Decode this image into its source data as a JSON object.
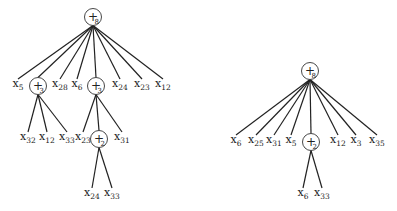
{
  "trees": [
    {
      "name": "left-tree",
      "nodes": [
        {
          "id": "L0",
          "type": "op",
          "op": "+",
          "arity": "8",
          "x": 93,
          "y": 17
        },
        {
          "id": "L1",
          "type": "leaf",
          "var": "x",
          "index": "5",
          "x": 18,
          "y": 87,
          "parent": "L0"
        },
        {
          "id": "L2",
          "type": "op",
          "op": "+",
          "arity": "3",
          "x": 38,
          "y": 86,
          "parent": "L0"
        },
        {
          "id": "L3",
          "type": "leaf",
          "var": "x",
          "index": "28",
          "x": 60,
          "y": 87,
          "parent": "L0"
        },
        {
          "id": "L4",
          "type": "leaf",
          "var": "x",
          "index": "6",
          "x": 77,
          "y": 87,
          "parent": "L0"
        },
        {
          "id": "L5",
          "type": "op",
          "op": "+",
          "arity": "3",
          "x": 96,
          "y": 86,
          "parent": "L0"
        },
        {
          "id": "L6",
          "type": "leaf",
          "var": "x",
          "index": "24",
          "x": 120,
          "y": 87,
          "parent": "L0"
        },
        {
          "id": "L7",
          "type": "leaf",
          "var": "x",
          "index": "23",
          "x": 142,
          "y": 87,
          "parent": "L0"
        },
        {
          "id": "L8",
          "type": "leaf",
          "var": "x",
          "index": "12",
          "x": 163,
          "y": 87,
          "parent": "L0"
        },
        {
          "id": "L9",
          "type": "leaf",
          "var": "x",
          "index": "32",
          "x": 28,
          "y": 140,
          "parent": "L2"
        },
        {
          "id": "L10",
          "type": "leaf",
          "var": "x",
          "index": "12",
          "x": 47,
          "y": 140,
          "parent": "L2"
        },
        {
          "id": "L11",
          "type": "leaf",
          "var": "x",
          "index": "33",
          "x": 67,
          "y": 140,
          "parent": "L2"
        },
        {
          "id": "L12",
          "type": "leaf",
          "var": "x",
          "index": "23",
          "x": 83,
          "y": 140,
          "parent": "L5"
        },
        {
          "id": "L13",
          "type": "op",
          "op": "+",
          "arity": "2",
          "x": 99,
          "y": 139,
          "parent": "L5"
        },
        {
          "id": "L14",
          "type": "leaf",
          "var": "x",
          "index": "31",
          "x": 122,
          "y": 140,
          "parent": "L5"
        },
        {
          "id": "L15",
          "type": "leaf",
          "var": "x",
          "index": "24",
          "x": 92,
          "y": 196,
          "parent": "L13"
        },
        {
          "id": "L16",
          "type": "leaf",
          "var": "x",
          "index": "33",
          "x": 112,
          "y": 196,
          "parent": "L13"
        }
      ]
    },
    {
      "name": "right-tree",
      "nodes": [
        {
          "id": "R0",
          "type": "op",
          "op": "+",
          "arity": "8",
          "x": 310,
          "y": 71
        },
        {
          "id": "R1",
          "type": "leaf",
          "var": "x",
          "index": "6",
          "x": 236,
          "y": 143,
          "parent": "R0"
        },
        {
          "id": "R2",
          "type": "leaf",
          "var": "x",
          "index": "25",
          "x": 256,
          "y": 143,
          "parent": "R0"
        },
        {
          "id": "R3",
          "type": "leaf",
          "var": "x",
          "index": "31",
          "x": 274,
          "y": 143,
          "parent": "R0"
        },
        {
          "id": "R4",
          "type": "leaf",
          "var": "x",
          "index": "5",
          "x": 291,
          "y": 143,
          "parent": "R0"
        },
        {
          "id": "R5",
          "type": "op",
          "op": "+",
          "arity": "2",
          "x": 311,
          "y": 142,
          "parent": "R0"
        },
        {
          "id": "R6",
          "type": "leaf",
          "var": "x",
          "index": "12",
          "x": 338,
          "y": 143,
          "parent": "R0"
        },
        {
          "id": "R7",
          "type": "leaf",
          "var": "x",
          "index": "3",
          "x": 356,
          "y": 143,
          "parent": "R0"
        },
        {
          "id": "R8",
          "type": "leaf",
          "var": "x",
          "index": "35",
          "x": 377,
          "y": 143,
          "parent": "R0"
        },
        {
          "id": "R9",
          "type": "leaf",
          "var": "x",
          "index": "6",
          "x": 303,
          "y": 196,
          "parent": "R5"
        },
        {
          "id": "R10",
          "type": "leaf",
          "var": "x",
          "index": "33",
          "x": 322,
          "y": 196,
          "parent": "R5"
        }
      ]
    }
  ],
  "style": {
    "edge_color": "#222222",
    "node_stroke": "#333333",
    "op_radius": 8.5
  }
}
